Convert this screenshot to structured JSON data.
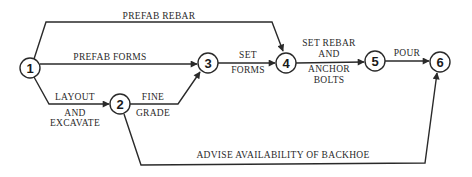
{
  "diagram": {
    "type": "activity-on-arrow network",
    "nodes": [
      {
        "id": "1",
        "label": "1"
      },
      {
        "id": "2",
        "label": "2"
      },
      {
        "id": "3",
        "label": "3"
      },
      {
        "id": "4",
        "label": "4"
      },
      {
        "id": "5",
        "label": "5"
      },
      {
        "id": "6",
        "label": "6"
      }
    ],
    "edges": [
      {
        "from": "1",
        "to": "4",
        "label": "PREFAB REBAR"
      },
      {
        "from": "1",
        "to": "3",
        "label": "PREFAB FORMS"
      },
      {
        "from": "1",
        "to": "2",
        "label_line1": "LAYOUT",
        "label_line2": "AND",
        "label_line3": "EXCAVATE"
      },
      {
        "from": "2",
        "to": "3",
        "label_line1": "FINE",
        "label_line2": "GRADE"
      },
      {
        "from": "3",
        "to": "4",
        "label_line1": "SET",
        "label_line2": "FORMS"
      },
      {
        "from": "4",
        "to": "5",
        "label_line1": "SET REBAR",
        "label_line2": "AND",
        "label_line3": "ANCHOR",
        "label_line4": "BOLTS"
      },
      {
        "from": "5",
        "to": "6",
        "label": "POUR"
      },
      {
        "from": "2",
        "to": "6",
        "label": "ADVISE AVAILABILITY OF BACKHOE"
      }
    ]
  },
  "colors": {
    "line": "#2a2a2a",
    "background": "#ffffff"
  }
}
